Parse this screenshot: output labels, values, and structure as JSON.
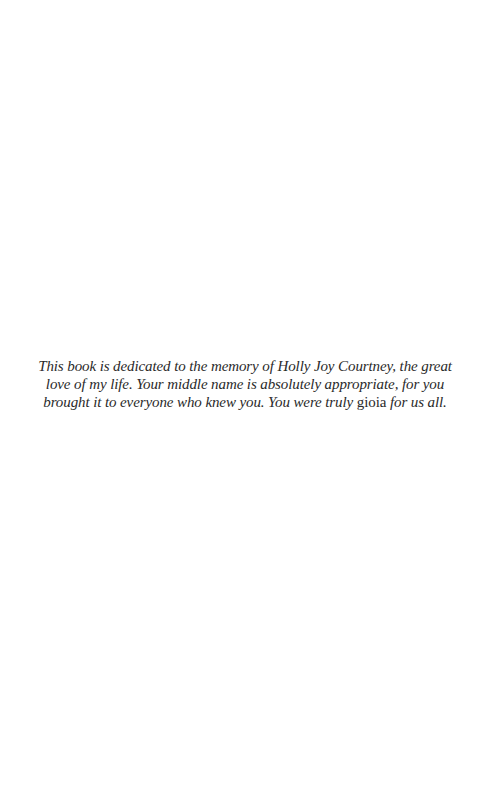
{
  "page": {
    "background": "#ffffff",
    "text_color": "#2a2a2a"
  },
  "dedication": {
    "before_emphasis": "This book is dedicated to the memory of Holly Joy Courtney, the great love of my life. Your middle name is absolutely appropriate, for you brought it to everyone who knew you. You were truly ",
    "emphasis_word": "gioia",
    "after_emphasis": " for us all."
  }
}
